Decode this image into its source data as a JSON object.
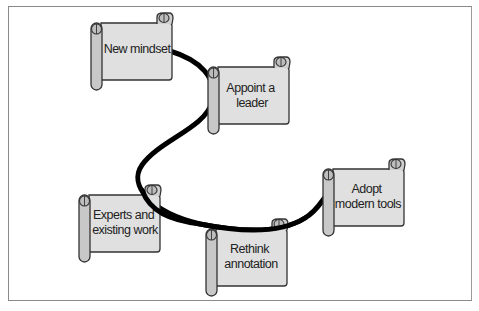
{
  "figure": {
    "type": "flow-of-scrolls",
    "connector": {
      "color": "#000000",
      "stroke_width": 5
    },
    "scroll_fill": "#e0e0e0",
    "roll_fill": "#c8c8c8",
    "outline": "#333333",
    "steps": [
      {
        "id": "new-mindset",
        "lines": [
          "New mindset"
        ]
      },
      {
        "id": "appoint-a-leader",
        "lines": [
          "Appoint a",
          "leader"
        ]
      },
      {
        "id": "experts-and-existing-work",
        "lines": [
          "Experts and",
          "existing work"
        ]
      },
      {
        "id": "rethink-annotation",
        "lines": [
          "Rethink",
          "annotation"
        ]
      },
      {
        "id": "adopt-modern-tools",
        "lines": [
          "Adopt",
          "modern tools"
        ]
      }
    ]
  }
}
